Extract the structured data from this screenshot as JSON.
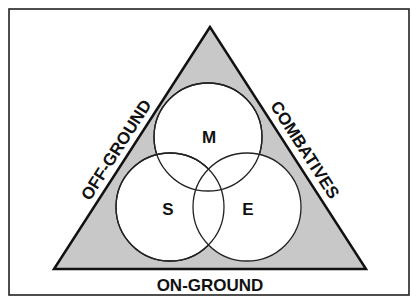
{
  "diagram": {
    "frame": {
      "x": 9,
      "y": 9,
      "width": 400,
      "height": 286
    },
    "triangle": {
      "fill": "#c8c8c8",
      "stroke": "#111111"
    },
    "sides": {
      "left": "OFF-GROUND",
      "right": "COMBATIVES",
      "bottom": "ON-GROUND"
    },
    "circles": [
      {
        "label": "M",
        "cx": 208,
        "cy": 137,
        "r": 54
      },
      {
        "label": "S",
        "cx": 170,
        "cy": 207,
        "r": 54
      },
      {
        "label": "E",
        "cx": 247,
        "cy": 207,
        "r": 54
      }
    ],
    "colors": {
      "background": "#ffffff",
      "fill": "#c8c8c8",
      "line": "#111111"
    }
  }
}
